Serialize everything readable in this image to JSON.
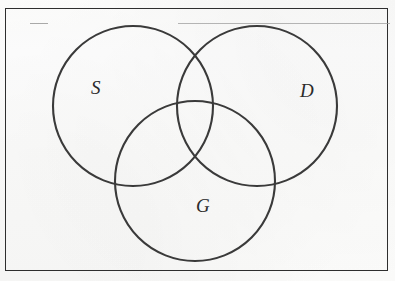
{
  "figure": {
    "type": "venn-diagram",
    "set_count": 3,
    "background_color": "#fdfdfc",
    "stroke_color": "#3a3a3a",
    "frame_color": "#2e2e2e"
  },
  "frame": {
    "name": "figure-border",
    "x": 5,
    "y": 8,
    "width": 383,
    "height": 263
  },
  "artifacts": {
    "top_rule_label": "",
    "left_dash_label": ""
  },
  "sets": [
    {
      "key": "S",
      "label": "S",
      "position": "left",
      "cx": 133,
      "cy": 106,
      "r": 80
    },
    {
      "key": "D",
      "label": "D",
      "position": "right",
      "cx": 257,
      "cy": 106,
      "r": 80
    },
    {
      "key": "G",
      "label": "G",
      "position": "bottom",
      "cx": 195,
      "cy": 181,
      "r": 80
    }
  ]
}
